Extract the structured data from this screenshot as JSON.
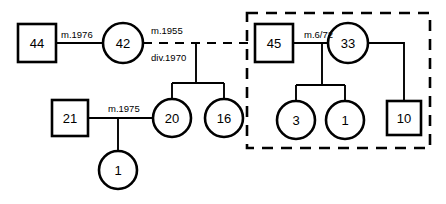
{
  "diagram": {
    "type": "genogram",
    "canvas": {
      "width": 446,
      "height": 204
    }
  },
  "persons": [
    {
      "id": "p44",
      "label": "44",
      "shape": "square",
      "gender": "male",
      "cx": 37,
      "cy": 43,
      "size": 38
    },
    {
      "id": "p42",
      "label": "42",
      "shape": "circle",
      "gender": "female",
      "cx": 123,
      "cy": 43,
      "size": 40
    },
    {
      "id": "p45",
      "label": "45",
      "shape": "square",
      "gender": "male",
      "cx": 274,
      "cy": 43,
      "size": 38
    },
    {
      "id": "p33",
      "label": "33",
      "shape": "circle",
      "gender": "female",
      "cx": 348,
      "cy": 43,
      "size": 40
    },
    {
      "id": "p21",
      "label": "21",
      "shape": "square",
      "gender": "male",
      "cx": 70,
      "cy": 118,
      "size": 36
    },
    {
      "id": "p20",
      "label": "20",
      "shape": "circle",
      "gender": "female",
      "cx": 172,
      "cy": 118,
      "size": 38
    },
    {
      "id": "p16",
      "label": "16",
      "shape": "circle",
      "gender": "female",
      "cx": 224,
      "cy": 118,
      "size": 38
    },
    {
      "id": "p3",
      "label": "3",
      "shape": "circle",
      "gender": "female",
      "cx": 296,
      "cy": 120,
      "size": 38
    },
    {
      "id": "p1b",
      "label": "1",
      "shape": "circle",
      "gender": "female",
      "cx": 345,
      "cy": 120,
      "size": 38
    },
    {
      "id": "p10",
      "label": "10",
      "shape": "square",
      "gender": "male",
      "cx": 404,
      "cy": 118,
      "size": 34
    },
    {
      "id": "p1a",
      "label": "1",
      "shape": "circle",
      "gender": "female",
      "cx": 118,
      "cy": 170,
      "size": 38
    }
  ],
  "relationship_labels": [
    {
      "id": "r1976",
      "text": "m.1976",
      "x": 61,
      "y": 34
    },
    {
      "id": "r1955",
      "text": "m.1955",
      "x": 151,
      "y": 30
    },
    {
      "id": "rdiv",
      "text": "div.1970",
      "x": 151,
      "y": 57
    },
    {
      "id": "r672",
      "text": "m.6/72",
      "x": 304,
      "y": 34
    },
    {
      "id": "r1975",
      "text": "m.1975",
      "x": 108,
      "y": 108
    }
  ],
  "connectors": [
    {
      "id": "c-44-42",
      "kind": "marriage-solid",
      "d": "M 56 43 L 103 43"
    },
    {
      "id": "c-42-45",
      "kind": "marriage-dashed",
      "d": "M 143 43 L 255 43"
    },
    {
      "id": "c-45-33",
      "kind": "marriage-solid",
      "d": "M 293 43 L 328 43"
    },
    {
      "id": "c-sib1-drop",
      "kind": "sibling",
      "d": "M 196 43 L 196 83"
    },
    {
      "id": "c-sib1-bar",
      "kind": "sibling",
      "d": "M 172 83 L 224 83"
    },
    {
      "id": "c-sib1-to-20",
      "kind": "sibling",
      "d": "M 172 83 L 172 99"
    },
    {
      "id": "c-sib1-to-16",
      "kind": "sibling",
      "d": "M 224 83 L 224 99"
    },
    {
      "id": "c-21-20",
      "kind": "marriage-solid",
      "d": "M 88 118 L 153 118"
    },
    {
      "id": "c-sib2-drop",
      "kind": "sibling",
      "d": "M 118 118 L 118 151"
    },
    {
      "id": "c-sib3-drop",
      "kind": "sibling",
      "d": "M 322 43 L 322 85"
    },
    {
      "id": "c-sib3-bar",
      "kind": "sibling",
      "d": "M 296 85 L 345 85"
    },
    {
      "id": "c-sib3-to-3",
      "kind": "sibling",
      "d": "M 296 85 L 296 101"
    },
    {
      "id": "c-sib3-to-1",
      "kind": "sibling",
      "d": "M 345 85 L 345 101"
    },
    {
      "id": "c-33-10",
      "kind": "sibling",
      "d": "M 368 43 L 404 43 L 404 101"
    }
  ],
  "household": {
    "id": "household-box",
    "x": 247,
    "y": 13,
    "width": 183,
    "height": 135
  }
}
